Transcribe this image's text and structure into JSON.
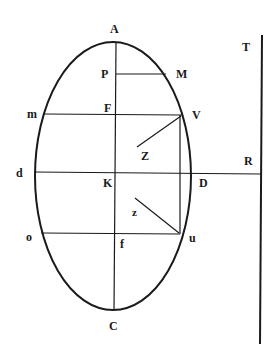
{
  "diagram": {
    "stroke_color": "#1a1a1a",
    "background": "#ffffff",
    "labels": {
      "A": "A",
      "P": "P",
      "M": "M",
      "T": "T",
      "m": "m",
      "F": "F",
      "V": "V",
      "Z": "Z",
      "R": "R",
      "d": "d",
      "K": "K",
      "D": "D",
      "z": "z",
      "o": "o",
      "f": "f",
      "u": "u",
      "C": "C"
    },
    "shapes": {
      "ellipse": {
        "cx": 113,
        "cy": 176,
        "rx": 78,
        "ry": 134
      },
      "axis_AC": {
        "x1": 116,
        "y1": 43,
        "x2": 114,
        "y2": 310
      },
      "line_PM": {
        "x1": 116,
        "y1": 74,
        "x2": 166,
        "y2": 74
      },
      "line_mV": {
        "x1": 44,
        "y1": 114,
        "x2": 182,
        "y2": 115
      },
      "line_Vu": {
        "x1": 180,
        "y1": 115,
        "x2": 180,
        "y2": 234
      },
      "line_dR": {
        "x1": 34,
        "y1": 172,
        "x2": 261,
        "y2": 174
      },
      "line_ou": {
        "x1": 41,
        "y1": 233,
        "x2": 180,
        "y2": 234
      },
      "line_TR": {
        "x1": 262,
        "y1": 35,
        "x2": 260,
        "y2": 344
      },
      "line_VZ": {
        "x1": 181,
        "y1": 116,
        "x2": 137,
        "y2": 147
      },
      "line_zu": {
        "x1": 135,
        "y1": 198,
        "x2": 179,
        "y2": 233
      }
    }
  }
}
